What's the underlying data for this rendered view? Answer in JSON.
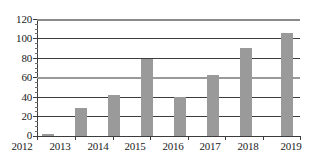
{
  "chart_data": {
    "type": "bar",
    "title": "",
    "subtitle": "",
    "xlabel": "",
    "ylabel": "",
    "categories": [
      "2012",
      "2013",
      "2014",
      "2015",
      "2016",
      "2017",
      "2018",
      "2019"
    ],
    "values": [
      2,
      29,
      42,
      79,
      40,
      63,
      90,
      106
    ],
    "ylim": [
      0,
      120
    ],
    "ytick_labels": [
      "0",
      "20",
      "40",
      "60",
      "80",
      "100",
      "120"
    ],
    "ytick_values": [
      0,
      20,
      40,
      60,
      80,
      100,
      120
    ],
    "grid": true,
    "grid_axis": "y",
    "legend": false,
    "legend_position": "none",
    "bar_color": "#9a9a9a",
    "grid_color": "#3c3c3c",
    "axis_color": "#3c3c3c",
    "text_color": "#1a1a1a",
    "background_color": "#ffffff"
  }
}
